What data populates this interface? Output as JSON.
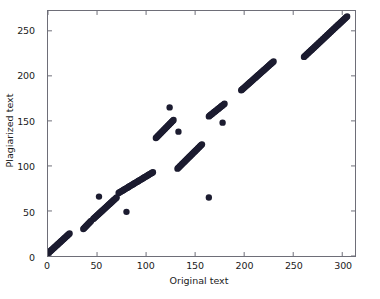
{
  "chart_data": {
    "type": "scatter",
    "title": "",
    "xlabel": "Original text",
    "ylabel": "Plagiarized text",
    "xlim": [
      0,
      313
    ],
    "ylim": [
      0,
      272
    ],
    "xticks": [
      0,
      50,
      100,
      150,
      200,
      250,
      300
    ],
    "yticks": [
      0,
      50,
      100,
      150,
      200,
      250
    ],
    "grid": false,
    "legend": null,
    "marker_color": "#1c1c30",
    "marker_size": 3.2,
    "frame_color": "#6e6e78",
    "background": "#ffffff",
    "segments": [
      {
        "name": "run-1",
        "x0": 0,
        "y0": 3,
        "x1": 22,
        "y1": 25,
        "n": 34
      },
      {
        "name": "run-2",
        "x0": 36,
        "y0": 30,
        "x1": 44,
        "y1": 39,
        "n": 14
      },
      {
        "name": "run-3",
        "x0": 46,
        "y0": 41,
        "x1": 70,
        "y1": 65,
        "n": 36
      },
      {
        "name": "run-4",
        "x0": 72,
        "y0": 70,
        "x1": 107,
        "y1": 93,
        "n": 46
      },
      {
        "name": "run-5",
        "x0": 110,
        "y0": 131,
        "x1": 128,
        "y1": 151,
        "n": 28
      },
      {
        "name": "run-6",
        "x0": 132,
        "y0": 97,
        "x1": 157,
        "y1": 124,
        "n": 38
      },
      {
        "name": "run-7",
        "x0": 164,
        "y0": 155,
        "x1": 180,
        "y1": 169,
        "n": 24
      },
      {
        "name": "run-8",
        "x0": 197,
        "y0": 184,
        "x1": 230,
        "y1": 216,
        "n": 48
      },
      {
        "name": "run-9",
        "x0": 261,
        "y0": 221,
        "x1": 305,
        "y1": 266,
        "n": 62
      }
    ],
    "outliers": [
      {
        "x": 52,
        "y": 66
      },
      {
        "x": 80,
        "y": 49
      },
      {
        "x": 124,
        "y": 165
      },
      {
        "x": 133,
        "y": 138
      },
      {
        "x": 178,
        "y": 148
      },
      {
        "x": 164,
        "y": 65
      }
    ]
  }
}
